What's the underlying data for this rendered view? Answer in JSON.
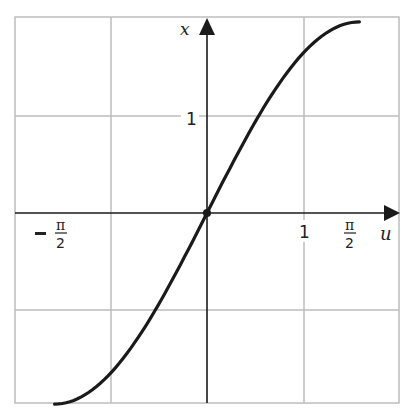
{
  "chart_data": {
    "type": "line",
    "title": "",
    "xlabel": "u",
    "ylabel": "x",
    "function": "x = 2 sin(u)",
    "xlim": [
      -2,
      2
    ],
    "ylim": [
      -2,
      2
    ],
    "grid": true,
    "x_ticks": [
      {
        "value": -1.5708,
        "label": "− π/2",
        "num": "π",
        "den": "2",
        "sign": "−"
      },
      {
        "value": 1,
        "label": "1"
      },
      {
        "value": 1.5708,
        "label": "π/2",
        "num": "π",
        "den": "2"
      }
    ],
    "y_ticks": [
      {
        "value": 1,
        "label": "1"
      }
    ],
    "series": [
      {
        "name": "x = 2 sin u",
        "x": [
          -1.5708,
          -1.2,
          -0.9,
          -0.6,
          -0.3,
          0,
          0.3,
          0.6,
          0.9,
          1.2,
          1.5708
        ],
        "y": [
          -2.0,
          -1.864,
          -1.567,
          -1.129,
          -0.591,
          0,
          0.591,
          1.129,
          1.567,
          1.864,
          2.0
        ]
      }
    ],
    "points": [
      {
        "x": 0,
        "y": 0,
        "label": "origin"
      }
    ],
    "colors": {
      "curve": "#1a1a1a",
      "grid": "#bdbdbd",
      "axis": "#1a1a1a"
    }
  },
  "labels": {
    "x_axis": "u",
    "y_axis": "x",
    "y_tick_1": "1",
    "x_tick_1": "1",
    "pi": "π",
    "two": "2",
    "minus": "−"
  }
}
